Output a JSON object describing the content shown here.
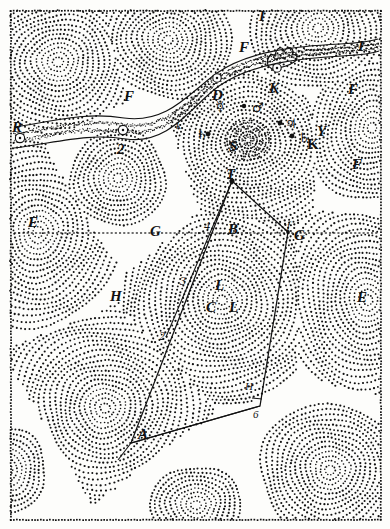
{
  "figure": {
    "ink_color": "#111111",
    "paper_color": "#fdfdfb"
  },
  "labels": [
    {
      "id": "R",
      "text": "R",
      "x": 12,
      "y": 120,
      "style": "cap"
    },
    {
      "id": "Q",
      "text": "2",
      "x": 117,
      "y": 142,
      "style": "cap"
    },
    {
      "id": "F1",
      "text": "F",
      "x": 124,
      "y": 89,
      "style": "cap"
    },
    {
      "id": "D",
      "text": "D",
      "x": 212,
      "y": 88,
      "style": "cap"
    },
    {
      "id": "I_top",
      "text": "I",
      "x": 259,
      "y": 9,
      "style": "cap"
    },
    {
      "id": "F2",
      "text": "F",
      "x": 239,
      "y": 40,
      "style": "cap"
    },
    {
      "id": "K_comet",
      "text": "K",
      "x": 269,
      "y": 81,
      "style": "cap"
    },
    {
      "id": "I_right",
      "text": "I",
      "x": 358,
      "y": 39,
      "style": "cap"
    },
    {
      "id": "F3",
      "text": "F",
      "x": 348,
      "y": 82,
      "style": "cap"
    },
    {
      "id": "F4",
      "text": "F",
      "x": 352,
      "y": 157,
      "style": "cap"
    },
    {
      "id": "k_small",
      "text": "k",
      "x": 176,
      "y": 120,
      "style": "small"
    },
    {
      "id": "t_small",
      "text": "t",
      "x": 199,
      "y": 128,
      "style": "small"
    },
    {
      "id": "S",
      "text": "S",
      "x": 229,
      "y": 139,
      "style": "cap"
    },
    {
      "id": "Y",
      "text": "Y",
      "x": 317,
      "y": 124,
      "style": "cap"
    },
    {
      "id": "K_y",
      "text": "K",
      "x": 307,
      "y": 137,
      "style": "capu"
    },
    {
      "id": "T",
      "text": "T",
      "x": 226,
      "y": 167,
      "style": "cap"
    },
    {
      "id": "E_left",
      "text": "E",
      "x": 28,
      "y": 215,
      "style": "cap"
    },
    {
      "id": "G_left",
      "text": "G",
      "x": 150,
      "y": 224,
      "style": "cap"
    },
    {
      "id": "B",
      "text": "B",
      "x": 228,
      "y": 222,
      "style": "cap"
    },
    {
      "id": "four",
      "text": "4",
      "x": 204,
      "y": 220,
      "style": "num"
    },
    {
      "id": "f_it",
      "text": "f",
      "x": 287,
      "y": 220,
      "style": "small"
    },
    {
      "id": "G_right",
      "text": "G",
      "x": 294,
      "y": 228,
      "style": "cap"
    },
    {
      "id": "E_right",
      "text": "E",
      "x": 357,
      "y": 290,
      "style": "cap"
    },
    {
      "id": "three",
      "text": "3",
      "x": 180,
      "y": 275,
      "style": "num"
    },
    {
      "id": "L1",
      "text": "L",
      "x": 215,
      "y": 278,
      "style": "cap"
    },
    {
      "id": "C",
      "text": "C",
      "x": 206,
      "y": 300,
      "style": "cap"
    },
    {
      "id": "L2",
      "text": "L",
      "x": 229,
      "y": 300,
      "style": "cap"
    },
    {
      "id": "H_left",
      "text": "H",
      "x": 110,
      "y": 289,
      "style": "cap"
    },
    {
      "id": "two",
      "text": "2",
      "x": 159,
      "y": 330,
      "style": "num"
    },
    {
      "id": "H_right",
      "text": "H",
      "x": 245,
      "y": 381,
      "style": "small"
    },
    {
      "id": "six",
      "text": "6",
      "x": 253,
      "y": 409,
      "style": "small"
    },
    {
      "id": "A",
      "text": "A",
      "x": 138,
      "y": 427,
      "style": "cap"
    }
  ],
  "planet_symbols": [
    {
      "id": "mercury",
      "glyph": "☿",
      "x": 216,
      "y": 100,
      "note": "Mercury"
    },
    {
      "id": "mars",
      "glyph": "♂",
      "x": 252,
      "y": 101,
      "note": "Mars"
    },
    {
      "id": "jupiter",
      "glyph": "♃",
      "x": 285,
      "y": 117,
      "note": "Jupiter"
    },
    {
      "id": "saturn_right",
      "glyph": "♄",
      "x": 298,
      "y": 131,
      "note": "Saturn"
    },
    {
      "id": "saturn_left",
      "glyph": "♄",
      "x": 196,
      "y": 128,
      "note": "Saturn"
    }
  ],
  "planet_dots": [
    {
      "id": "dot-mars",
      "x": 244,
      "y": 106,
      "r": 2.2
    },
    {
      "id": "dot-jupiter",
      "x": 280,
      "y": 123,
      "r": 2.4
    },
    {
      "id": "dot-saturn-right",
      "x": 292,
      "y": 136,
      "r": 2.4
    },
    {
      "id": "dot-saturn-left",
      "x": 208,
      "y": 134,
      "r": 2.4
    }
  ],
  "comet_nodes": [
    {
      "id": "node-R",
      "x": 20,
      "y": 138,
      "r": 4.6
    },
    {
      "id": "node-Q",
      "x": 123,
      "y": 130,
      "r": 4.6
    },
    {
      "id": "node-D",
      "x": 217,
      "y": 78,
      "r": 4.2
    },
    {
      "id": "node-K",
      "x": 277,
      "y": 68,
      "r": 4.2
    }
  ],
  "quadrilateral": {
    "vertices": [
      {
        "id": "T",
        "x": 232,
        "y": 181
      },
      {
        "id": "f",
        "x": 288,
        "y": 232
      },
      {
        "id": "6",
        "x": 260,
        "y": 406
      },
      {
        "id": "A",
        "x": 131,
        "y": 443
      }
    ],
    "inner_lines": [
      {
        "id": "T-2",
        "from": {
          "x": 232,
          "y": 181
        },
        "to": {
          "x": 166,
          "y": 337
        }
      },
      {
        "id": "A-6",
        "from": {
          "x": 131,
          "y": 443
        },
        "to": {
          "x": 260,
          "y": 406
        }
      },
      {
        "id": "A-bot",
        "from": {
          "x": 131,
          "y": 443
        },
        "to": {
          "x": 118,
          "y": 460
        }
      }
    ]
  },
  "dashed_axis": {
    "id": "G-G-axis",
    "y": 233,
    "x1": 14,
    "x2": 376
  }
}
